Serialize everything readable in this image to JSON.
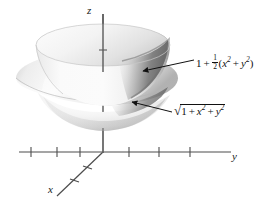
{
  "figure": {
    "kind": "3d-surface-plot",
    "background": "#ffffff",
    "ink": "#1a1a1a"
  },
  "axes": {
    "z": {
      "name": "z-axis",
      "label": "z",
      "ticks": 1
    },
    "y": {
      "name": "y-axis",
      "label": "y",
      "ticks": 6
    },
    "x": {
      "name": "x-axis",
      "label": "x",
      "ticks": 2
    }
  },
  "annotations": [
    {
      "name": "paraboloid-label",
      "target": "inner-paraboloid-surface",
      "parts": {
        "constant": "1",
        "operator": "+",
        "frac_num": "1",
        "frac_den": "2",
        "open": "(",
        "x": "x",
        "x_exp": "2",
        "inner_op": "+",
        "y": "y",
        "y_exp": "2",
        "close": ")"
      },
      "plain": "1 + 1/2(x^2 + y^2)"
    },
    {
      "name": "hyperboloid-label",
      "target": "outer-hyperboloid-surface",
      "parts": {
        "radical": "√",
        "constant": "1",
        "operator": "+",
        "x": "x",
        "x_exp": "2",
        "inner_op": "+",
        "y": "y",
        "y_exp": "2"
      },
      "plain": "sqrt(1 + x^2 + y^2)"
    }
  ],
  "surfaces": [
    {
      "name": "inner-paraboloid-surface",
      "equation": "z = 1 + 1/2(x^2 + y^2)",
      "fill": "#f2f2f2"
    },
    {
      "name": "outer-hyperboloid-surface",
      "equation": "z = sqrt(1 + x^2 + y^2)",
      "fill": "#ededed"
    }
  ],
  "colors": {
    "ink": "#1a1a1a",
    "surface_light": "#fbfbfb",
    "surface_mid": "#e6e6e6",
    "surface_shadow": "#8f8f8f",
    "surface_deep": "#6e6e6e"
  }
}
